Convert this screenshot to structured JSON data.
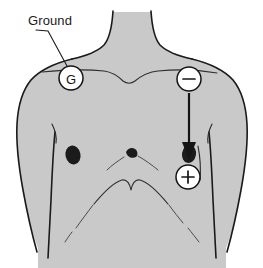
{
  "figure": {
    "title": "Ground",
    "kind": "anatomical-diagram",
    "width": 263,
    "height": 268,
    "background_color": "#ffffff",
    "body_fill_color": "#c9c9c9",
    "outline_color": "#1a1a1a"
  },
  "labels": {
    "ground": "Ground"
  },
  "electrodes": [
    {
      "id": "ground",
      "name": "ground-electrode",
      "glyph": "G",
      "glyph_type": "letter",
      "cx": 71,
      "cy": 78,
      "r": 12,
      "fill": "#ffffff",
      "stroke": "#141414"
    },
    {
      "id": "negative",
      "name": "negative-electrode",
      "glyph": "−",
      "glyph_type": "minus",
      "cx": 189,
      "cy": 79,
      "r": 12,
      "fill": "#ffffff",
      "stroke": "#141414"
    },
    {
      "id": "positive",
      "name": "positive-electrode",
      "glyph": "+",
      "glyph_type": "plus",
      "cx": 188,
      "cy": 177,
      "r": 12,
      "fill": "#ffffff",
      "stroke": "#141414"
    }
  ],
  "arrow": {
    "name": "placement-arrow",
    "from": "negative-electrode",
    "to": "right-nipple",
    "x": 189,
    "y_start": 93,
    "y_end": 155,
    "color": "#151515"
  },
  "leader": {
    "name": "ground-leader-line",
    "from_label": "Ground",
    "to_electrode": "ground-electrode",
    "x1": 48,
    "y1": 30,
    "x2": 67,
    "y2": 66,
    "color": "#1a1a1a"
  },
  "anatomy_marks": [
    {
      "name": "left-nipple",
      "cx": 73,
      "cy": 155
    },
    {
      "name": "right-nipple",
      "cx": 189,
      "cy": 155
    },
    {
      "name": "clavicle-line"
    },
    {
      "name": "suprasternal-notch"
    },
    {
      "name": "sternum-xiphoid"
    },
    {
      "name": "costal-margin-arch"
    },
    {
      "name": "left-arm-crease"
    },
    {
      "name": "right-arm-crease"
    }
  ]
}
